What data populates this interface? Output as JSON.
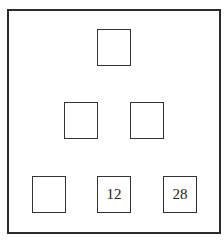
{
  "diagram": {
    "type": "number-pyramid",
    "rows": [
      {
        "row": 1,
        "cells": [
          {
            "id": "r1c1",
            "value": "",
            "x": 97,
            "y": 29
          }
        ]
      },
      {
        "row": 2,
        "cells": [
          {
            "id": "r2c1",
            "value": "",
            "x": 64,
            "y": 102
          },
          {
            "id": "r2c2",
            "value": "",
            "x": 130,
            "y": 102
          }
        ]
      },
      {
        "row": 3,
        "cells": [
          {
            "id": "r3c1",
            "value": "",
            "x": 32,
            "y": 176
          },
          {
            "id": "r3c2",
            "value": "12",
            "x": 97,
            "y": 176
          },
          {
            "id": "r3c3",
            "value": "28",
            "x": 163,
            "y": 176
          }
        ]
      }
    ]
  },
  "colors": {
    "border": "#2b2b2b",
    "background": "#ffffff",
    "text": "#222222"
  }
}
